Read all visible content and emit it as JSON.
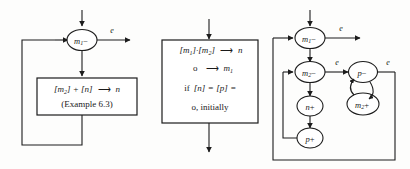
{
  "figure": {
    "background_color": "#fdfdfc",
    "line_color": "#1c1c1c"
  },
  "panel_left": {
    "name": "panel-left",
    "node_circle": {
      "label_base": "m",
      "label_sub": "1",
      "label_op": "−",
      "full": "m₁−"
    },
    "edge_label_out": "e",
    "box": {
      "line1_a": "[m",
      "line1_a_sub": "2",
      "line1_b": "] + [n]",
      "line1_arrow": "⟶",
      "line1_c": "n",
      "line1_full": "[m₂] + [n] ⟶ n",
      "line2": "(Example 6.3)"
    }
  },
  "panel_middle": {
    "name": "panel-middle",
    "box": {
      "line1_full": "[m₁]·[m₂] ⟶ n",
      "line1_a": "[m",
      "line1_a_sub": "1",
      "line1_b": "]·[m",
      "line1_b_sub": "2",
      "line1_c": "]",
      "line1_arrow": "⟶",
      "line1_d": "n",
      "line2_full": "o ⟶ m₁",
      "line2_a": "o",
      "line2_arrow": "⟶",
      "line2_b": "m",
      "line2_b_sub": "1",
      "line3_full": "if [n] = [p] =",
      "line3_if": "if",
      "line3_rest": "[n] = [p] =",
      "line4_full": "o, initially"
    }
  },
  "panel_right": {
    "name": "panel-right",
    "nodes": [
      {
        "id": "m1-minus",
        "base": "m",
        "sub": "1",
        "op": "−",
        "full": "m₁−"
      },
      {
        "id": "m2-minus",
        "base": "m",
        "sub": "2",
        "op": "−",
        "full": "m₂−"
      },
      {
        "id": "n-plus",
        "base": "n",
        "sub": "",
        "op": "+",
        "full": "n+"
      },
      {
        "id": "p-plus",
        "base": "p",
        "sub": "",
        "op": "+",
        "full": "p+"
      },
      {
        "id": "p-minus",
        "base": "p",
        "sub": "",
        "op": "−",
        "full": "p−"
      },
      {
        "id": "m2-plus",
        "base": "m",
        "sub": "2",
        "op": "+",
        "full": "m₂+"
      }
    ],
    "edge_labels": {
      "top_out": "e",
      "mid_out": "e",
      "right_out": "e"
    }
  }
}
